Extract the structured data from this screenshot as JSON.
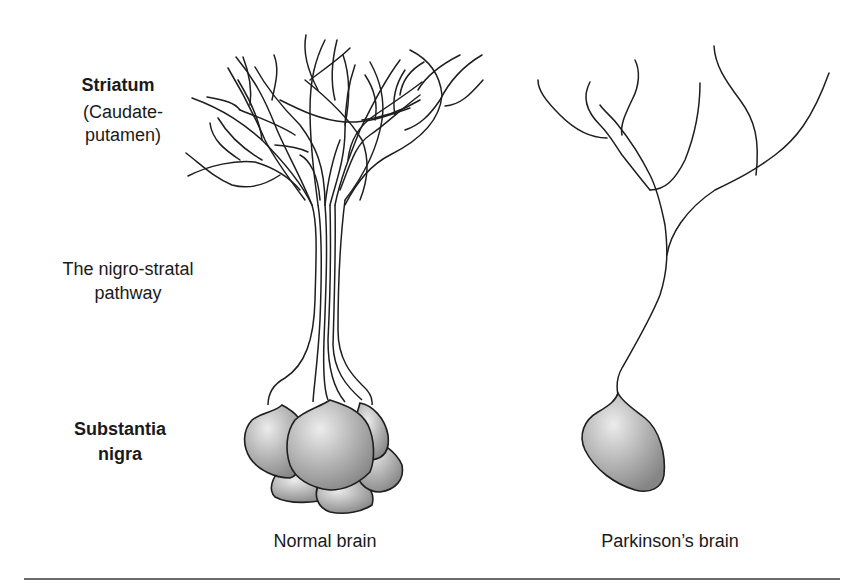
{
  "figure": {
    "labels": {
      "striatum_title": "Striatum",
      "striatum_sub_line1": "(Caudate-",
      "striatum_sub_line2": "putamen)",
      "pathway_line1": "The nigro-stratal",
      "pathway_line2": "pathway",
      "substantia_line1": "Substantia",
      "substantia_line2": "nigra"
    },
    "panels": [
      {
        "id": "normal",
        "caption": "Normal brain",
        "cell_bodies": 6,
        "axon_count": 6
      },
      {
        "id": "parkinsons",
        "caption": "Parkinson’s brain",
        "cell_bodies": 1,
        "axon_count": 1
      }
    ],
    "colors": {
      "line": "#1e1e1e",
      "cell_fill_light": "#e6e6e6",
      "cell_fill_dark": "#8a8a8a",
      "rule": "#6b6b6b",
      "background": "#ffffff"
    }
  }
}
